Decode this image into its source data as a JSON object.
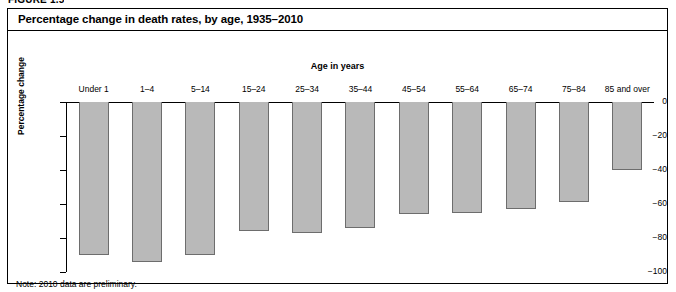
{
  "figure_label": "FIGURE 1.5",
  "chart_title": "Percentage change in death rates, by age, 1935–2010",
  "note": "Note: 2010 data are preliminary.",
  "colors": {
    "bar_fill": "#b9b9b9",
    "bar_border": "#6d6d6d",
    "axis": "#000000",
    "frame": "#000000",
    "background": "#ffffff"
  },
  "chart_data": {
    "type": "bar",
    "title": "Percentage change in death rates, by age, 1935–2010",
    "xlabel": "Age in years",
    "ylabel": "Percentage change",
    "categories": [
      "Under 1",
      "1–4",
      "5–14",
      "15–24",
      "25–34",
      "35–44",
      "45–54",
      "55–64",
      "65–74",
      "75–84",
      "85 and over"
    ],
    "values": [
      -90,
      -94,
      -90,
      -76,
      -77,
      -74,
      -66,
      -65,
      -63,
      -59,
      -40
    ],
    "ylim": [
      -100,
      0
    ],
    "yticks": [
      0,
      -20,
      -40,
      -60,
      -80,
      -100
    ],
    "ytick_labels": [
      "0",
      "−20",
      "−40",
      "−60",
      "−80",
      "−100"
    ],
    "grid": false,
    "legend": false,
    "orientation": "vertical",
    "note": "Note: 2010 data are preliminary."
  }
}
